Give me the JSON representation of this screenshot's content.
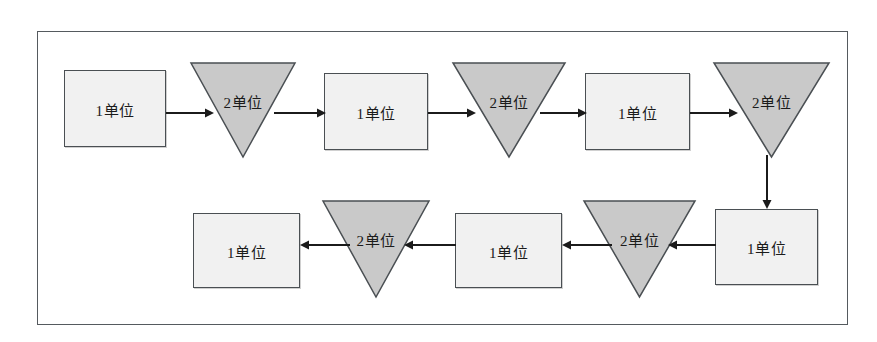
{
  "diagram": {
    "frame": {
      "x": 37,
      "y": 31,
      "width": 811,
      "height": 294
    },
    "colors": {
      "frame_border": "#555a5e",
      "rect_fill": "#f1f1f1",
      "rect_border": "#4a4f53",
      "triangle_fill": "#c9c9c9",
      "triangle_border": "#4a4f53",
      "arrow": "#1b1b1b",
      "text": "#1b1b1b",
      "background": "#ffffff"
    },
    "labels": {
      "rect": "1单位",
      "triangle": "2单位"
    },
    "nodes": [
      {
        "id": "r1",
        "shape": "rectangle",
        "label": "1单位",
        "row": "top",
        "order": 1,
        "x": 64,
        "y": 70,
        "width": 102,
        "height": 77
      },
      {
        "id": "t1",
        "shape": "triangle-down",
        "label": "2单位",
        "row": "top",
        "order": 2,
        "x": 190,
        "y": 62,
        "width": 106,
        "height": 96
      },
      {
        "id": "r2",
        "shape": "rectangle",
        "label": "1单位",
        "row": "top",
        "order": 3,
        "x": 324,
        "y": 73,
        "width": 104,
        "height": 77
      },
      {
        "id": "t2",
        "shape": "triangle-down",
        "label": "2单位",
        "row": "top",
        "order": 4,
        "x": 452,
        "y": 62,
        "width": 114,
        "height": 96
      },
      {
        "id": "r3",
        "shape": "rectangle",
        "label": "1单位",
        "row": "top",
        "order": 5,
        "x": 585,
        "y": 73,
        "width": 105,
        "height": 77
      },
      {
        "id": "t3",
        "shape": "triangle-down",
        "label": "2单位",
        "row": "top",
        "order": 6,
        "x": 713,
        "y": 62,
        "width": 117,
        "height": 96
      },
      {
        "id": "r4",
        "shape": "rectangle",
        "label": "1单位",
        "row": "bottom",
        "order": 7,
        "x": 715,
        "y": 209,
        "width": 103,
        "height": 76
      },
      {
        "id": "t4",
        "shape": "triangle-down",
        "label": "2单位",
        "row": "bottom",
        "order": 8,
        "x": 583,
        "y": 200,
        "width": 113,
        "height": 98
      },
      {
        "id": "r5",
        "shape": "rectangle",
        "label": "1单位",
        "row": "bottom",
        "order": 9,
        "x": 455,
        "y": 213,
        "width": 107,
        "height": 75
      },
      {
        "id": "t5",
        "shape": "triangle-down",
        "label": "2单位",
        "row": "bottom",
        "order": 10,
        "x": 322,
        "y": 200,
        "width": 108,
        "height": 98
      },
      {
        "id": "r6",
        "shape": "rectangle",
        "label": "1单位",
        "row": "bottom",
        "order": 11,
        "x": 193,
        "y": 213,
        "width": 107,
        "height": 75
      }
    ],
    "connections": [
      {
        "id": "a1",
        "from": "r1",
        "to": "t1",
        "direction": "right",
        "x": 166,
        "y": 113,
        "length": 48
      },
      {
        "id": "a2",
        "from": "t1",
        "to": "r2",
        "direction": "right",
        "x": 274,
        "y": 113,
        "length": 52
      },
      {
        "id": "a3",
        "from": "r2",
        "to": "t2",
        "direction": "right",
        "x": 428,
        "y": 113,
        "length": 48
      },
      {
        "id": "a4",
        "from": "t2",
        "to": "r3",
        "direction": "right",
        "x": 540,
        "y": 113,
        "length": 47
      },
      {
        "id": "a5",
        "from": "r3",
        "to": "t3",
        "direction": "right",
        "x": 690,
        "y": 113,
        "length": 48
      },
      {
        "id": "a6",
        "from": "t3",
        "to": "r4",
        "direction": "down",
        "x": 767,
        "y": 155,
        "length": 54
      },
      {
        "id": "a7",
        "from": "r4",
        "to": "t4",
        "direction": "left",
        "x": 668,
        "y": 245,
        "length": 48
      },
      {
        "id": "a8",
        "from": "t4",
        "to": "r5",
        "direction": "left",
        "x": 562,
        "y": 245,
        "length": 50
      },
      {
        "id": "a9",
        "from": "r5",
        "to": "t5",
        "direction": "left",
        "x": 404,
        "y": 245,
        "length": 52
      },
      {
        "id": "a10",
        "from": "t5",
        "to": "r6",
        "direction": "left",
        "x": 300,
        "y": 245,
        "length": 50
      }
    ]
  }
}
